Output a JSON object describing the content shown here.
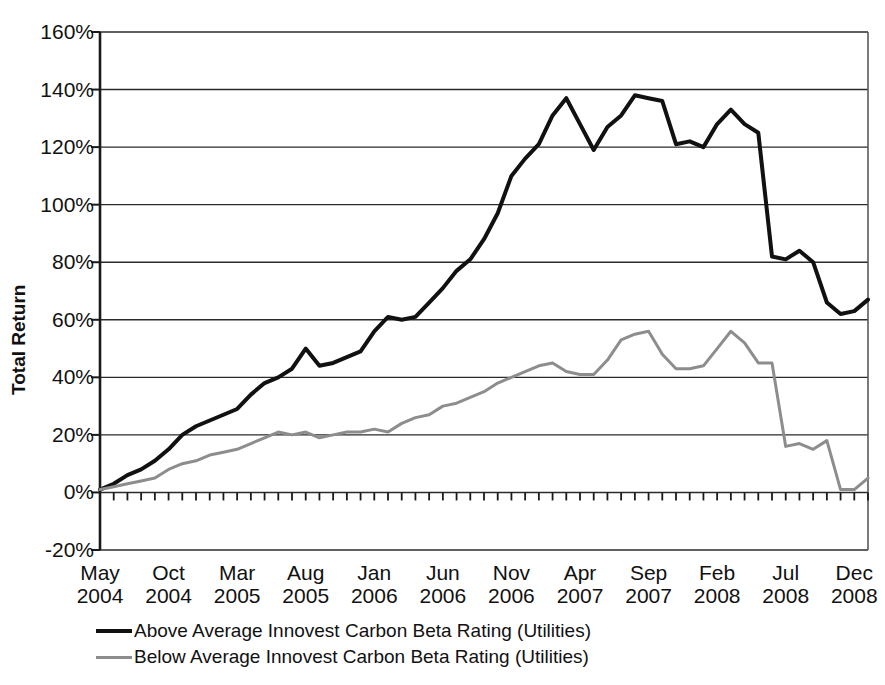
{
  "chart_data": {
    "type": "line",
    "title": "",
    "xlabel": "",
    "ylabel": "Total Return",
    "ylim": [
      -20,
      160
    ],
    "ytick_labels": [
      "160%",
      "140%",
      "120%",
      "100%",
      "80%",
      "60%",
      "40%",
      "20%",
      "0%",
      "-20%"
    ],
    "ytick_values": [
      160,
      140,
      120,
      100,
      80,
      60,
      40,
      20,
      0,
      -20
    ],
    "grid": "horizontal",
    "legend_position": "below-axis",
    "xtick_labels": [
      {
        "month": "May",
        "year": "2004"
      },
      {
        "month": "Oct",
        "year": "2004"
      },
      {
        "month": "Mar",
        "year": "2005"
      },
      {
        "month": "Aug",
        "year": "2005"
      },
      {
        "month": "Jan",
        "year": "2006"
      },
      {
        "month": "Jun",
        "year": "2006"
      },
      {
        "month": "Nov",
        "year": "2006"
      },
      {
        "month": "Apr",
        "year": "2007"
      },
      {
        "month": "Sep",
        "year": "2007"
      },
      {
        "month": "Feb",
        "year": "2008"
      },
      {
        "month": "Jul",
        "year": "2008"
      },
      {
        "month": "Dec",
        "year": "2008"
      }
    ],
    "x": [
      "2004-05",
      "2004-06",
      "2004-07",
      "2004-08",
      "2004-09",
      "2004-10",
      "2004-11",
      "2004-12",
      "2005-01",
      "2005-02",
      "2005-03",
      "2005-04",
      "2005-05",
      "2005-06",
      "2005-07",
      "2005-08",
      "2005-09",
      "2005-10",
      "2005-11",
      "2005-12",
      "2006-01",
      "2006-02",
      "2006-03",
      "2006-04",
      "2006-05",
      "2006-06",
      "2006-07",
      "2006-08",
      "2006-09",
      "2006-10",
      "2006-11",
      "2006-12",
      "2007-01",
      "2007-02",
      "2007-03",
      "2007-04",
      "2007-05",
      "2007-06",
      "2007-07",
      "2007-08",
      "2007-09",
      "2007-10",
      "2007-11",
      "2007-12",
      "2008-01",
      "2008-02",
      "2008-03",
      "2008-04",
      "2008-05",
      "2008-06",
      "2008-07",
      "2008-08",
      "2008-09",
      "2008-10",
      "2008-11",
      "2008-12",
      "2009-01"
    ],
    "series": [
      {
        "name": "Above Average Innovest Carbon Beta Rating (Utilities)",
        "color": "#111111",
        "width": 4,
        "values": [
          1,
          3,
          6,
          8,
          11,
          15,
          20,
          23,
          25,
          27,
          29,
          34,
          38,
          40,
          43,
          50,
          44,
          45,
          47,
          49,
          56,
          61,
          60,
          61,
          66,
          71,
          77,
          81,
          88,
          97,
          110,
          116,
          121,
          131,
          137,
          128,
          119,
          127,
          131,
          138,
          137,
          136,
          121,
          122,
          120,
          128,
          133,
          128,
          125,
          82,
          81,
          84,
          80,
          66,
          62,
          63,
          67
        ]
      },
      {
        "name": "Below Average Innovest Carbon Beta Rating (Utilities)",
        "color": "#8d8d8d",
        "width": 3,
        "values": [
          1,
          2,
          3,
          4,
          5,
          8,
          10,
          11,
          13,
          14,
          15,
          17,
          19,
          21,
          20,
          21,
          19,
          20,
          21,
          21,
          22,
          21,
          24,
          26,
          27,
          30,
          31,
          33,
          35,
          38,
          40,
          42,
          44,
          45,
          42,
          41,
          41,
          46,
          53,
          55,
          56,
          48,
          43,
          43,
          44,
          50,
          56,
          52,
          45,
          45,
          16,
          17,
          15,
          18,
          1,
          1,
          5
        ]
      }
    ]
  },
  "legend": {
    "items": [
      {
        "label": "Above Average Innovest Carbon Beta Rating (Utilities)",
        "style": "thick"
      },
      {
        "label": "Below Average Innovest Carbon Beta Rating (Utilities)",
        "style": "thin"
      }
    ]
  }
}
